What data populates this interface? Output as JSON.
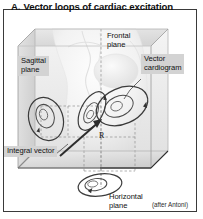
{
  "figure": {
    "letter": "A.",
    "title": "Vector loops of cardiac excitation",
    "credit": "(after Antoni)"
  },
  "labels": {
    "frontal_plane": "Frontal\nplane",
    "sagittal_plane": "Sagittal\nplane",
    "vector_cardiogram": "Vector\ncardiogram",
    "integral_vector": "Integral vector",
    "horizontal_plane": "Horizontal\nplane",
    "r_vector": "R"
  },
  "colors": {
    "frame_border": "#3a3a3a",
    "callout_bg": "#d3d3d3",
    "text": "#111111",
    "box_face_light": "#f0f0f0",
    "box_face_mid": "#dedede",
    "box_face_shadow": "#cfcfcf",
    "loop_stroke": "#3b3b3b",
    "dashed_stroke": "#8c8c8c",
    "torso_fill": "#f6f6f6"
  },
  "artwork": {
    "description": "Three-dimensional schematic box containing a semi-transparent thorax with the heart; three vector-cardiogram loops are projected onto the frontal, sagittal and horizontal planes, with the integral vector arrow labelled R."
  }
}
